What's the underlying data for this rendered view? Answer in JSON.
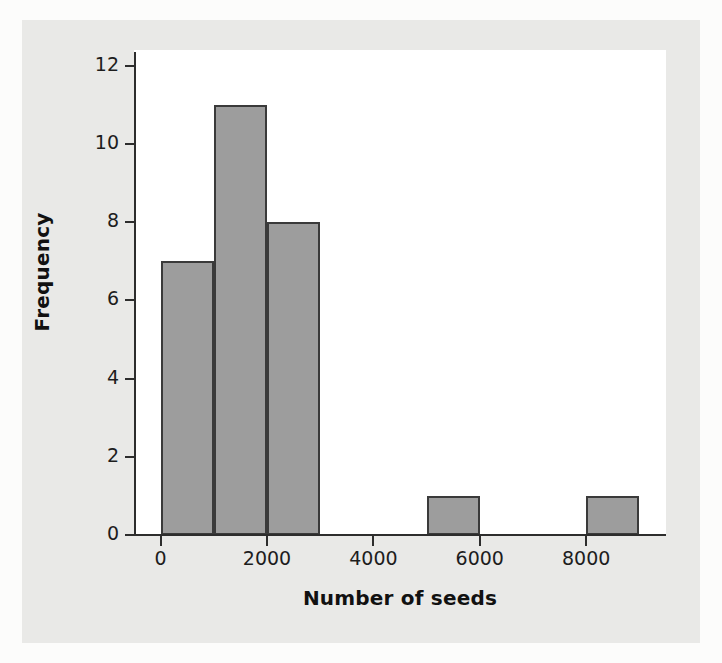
{
  "figure": {
    "background_color": "#e9e9e7",
    "plot_background_color": "#ffffff",
    "axis_color": "#2d2d2d",
    "bar_fill_color": "#9d9d9d",
    "bar_edge_color": "#3a3a3a"
  },
  "chart_data": {
    "type": "bar",
    "title": "",
    "subtitle": "",
    "xlabel": "Number of seeds",
    "ylabel": "Frequency",
    "xlim": [
      -500,
      9500
    ],
    "ylim": [
      0,
      12.4
    ],
    "grid": false,
    "legend": null,
    "xticks": [
      0,
      2000,
      4000,
      6000,
      8000
    ],
    "xtick_labels": [
      "0",
      "2000",
      "4000",
      "6000",
      "8000"
    ],
    "yticks": [
      0,
      2,
      4,
      6,
      8,
      10,
      12
    ],
    "ytick_labels": [
      "0",
      "2",
      "4",
      "6",
      "8",
      "10",
      "12"
    ],
    "bin_width": 1000,
    "bins": [
      {
        "bin_start": 0,
        "bin_end": 1000,
        "label": "0–1000",
        "value": 7
      },
      {
        "bin_start": 1000,
        "bin_end": 2000,
        "label": "1000–2000",
        "value": 11
      },
      {
        "bin_start": 2000,
        "bin_end": 3000,
        "label": "2000–3000",
        "value": 8
      },
      {
        "bin_start": 3000,
        "bin_end": 4000,
        "label": "3000–4000",
        "value": 0
      },
      {
        "bin_start": 4000,
        "bin_end": 5000,
        "label": "4000–5000",
        "value": 0
      },
      {
        "bin_start": 5000,
        "bin_end": 6000,
        "label": "5000–6000",
        "value": 1
      },
      {
        "bin_start": 6000,
        "bin_end": 7000,
        "label": "6000–7000",
        "value": 0
      },
      {
        "bin_start": 7000,
        "bin_end": 8000,
        "label": "7000–8000",
        "value": 0
      },
      {
        "bin_start": 8000,
        "bin_end": 9000,
        "label": "8000–9000",
        "value": 1
      }
    ],
    "categories": [
      "0–1000",
      "1000–2000",
      "2000–3000",
      "3000–4000",
      "4000–5000",
      "5000–6000",
      "6000–7000",
      "7000–8000",
      "8000–9000"
    ],
    "values": [
      7,
      11,
      8,
      0,
      0,
      1,
      0,
      0,
      1
    ]
  }
}
